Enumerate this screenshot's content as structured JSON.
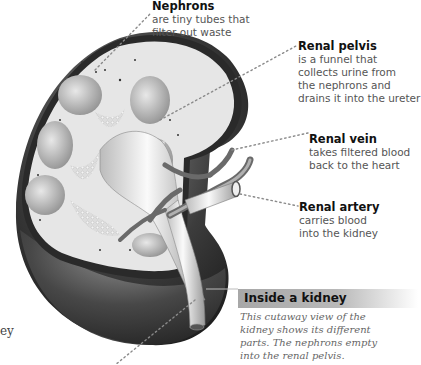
{
  "diagram": {
    "labels": [
      {
        "id": "nephrons",
        "title": "Nephrons",
        "description": "are tiny tubes that\nfilter out waste"
      },
      {
        "id": "renal-pelvis",
        "title": "Renal pelvis",
        "description": "is a funnel that\ncollects urine from\nthe nephrons and\ndrains it into the ureter"
      },
      {
        "id": "renal-vein",
        "title": "Renal vein",
        "description": "takes filtered blood\nback to the heart"
      },
      {
        "id": "renal-artery",
        "title": "Renal artery",
        "description": "carries blood\ninto the kidney"
      }
    ],
    "caption": {
      "title": "Inside a kidney",
      "body": "This cutaway view of the\nkidney shows its different\nparts. The nephrons empty\ninto the renal pelvis."
    },
    "left_fragment": "ey",
    "colors": {
      "caption_header": "#a8a8a8",
      "label_title": "#111111",
      "label_text": "#555555",
      "caption_text": "#666666",
      "leader_dots": "#888888"
    }
  }
}
